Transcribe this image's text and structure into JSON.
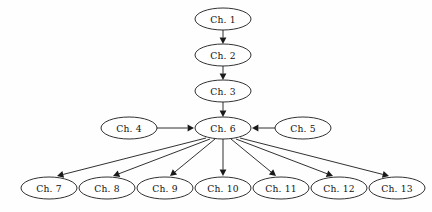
{
  "figure": {
    "type": "directed-graph",
    "background_color": "#fefefe",
    "stroke_color": "#1a1a1a",
    "node_fill": "#ffffff",
    "node_shape": "ellipse",
    "width": 432,
    "height": 212
  },
  "nodes": [
    {
      "id": "ch1",
      "label": "Ch. 1",
      "cx": 223,
      "cy": 19,
      "rx": 28,
      "ry": 11
    },
    {
      "id": "ch2",
      "label": "Ch. 2",
      "cx": 223,
      "cy": 55,
      "rx": 28,
      "ry": 11
    },
    {
      "id": "ch3",
      "label": "Ch. 3",
      "cx": 223,
      "cy": 91,
      "rx": 28,
      "ry": 11
    },
    {
      "id": "ch4",
      "label": "Ch. 4",
      "cx": 129,
      "cy": 128,
      "rx": 28,
      "ry": 11
    },
    {
      "id": "ch6",
      "label": "Ch. 6",
      "cx": 223,
      "cy": 128,
      "rx": 28,
      "ry": 11
    },
    {
      "id": "ch5",
      "label": "Ch. 5",
      "cx": 303,
      "cy": 128,
      "rx": 28,
      "ry": 11
    },
    {
      "id": "ch7",
      "label": "Ch. 7",
      "cx": 49,
      "cy": 188,
      "rx": 28,
      "ry": 11
    },
    {
      "id": "ch8",
      "label": "Ch. 8",
      "cx": 107,
      "cy": 188,
      "rx": 28,
      "ry": 11
    },
    {
      "id": "ch9",
      "label": "Ch. 9",
      "cx": 165,
      "cy": 188,
      "rx": 28,
      "ry": 11
    },
    {
      "id": "ch10",
      "label": "Ch. 10",
      "cx": 223,
      "cy": 188,
      "rx": 28,
      "ry": 11
    },
    {
      "id": "ch11",
      "label": "Ch. 11",
      "cx": 281,
      "cy": 188,
      "rx": 28,
      "ry": 11
    },
    {
      "id": "ch12",
      "label": "Ch. 12",
      "cx": 339,
      "cy": 188,
      "rx": 28,
      "ry": 11
    },
    {
      "id": "ch13",
      "label": "Ch. 13",
      "cx": 397,
      "cy": 188,
      "rx": 28,
      "ry": 11
    }
  ],
  "edges": [
    {
      "from": "ch1",
      "to": "ch2",
      "x1": 223,
      "y1": 30,
      "x2": 223,
      "y2": 44
    },
    {
      "from": "ch2",
      "to": "ch3",
      "x1": 223,
      "y1": 66,
      "x2": 223,
      "y2": 80
    },
    {
      "from": "ch3",
      "to": "ch6",
      "x1": 223,
      "y1": 102,
      "x2": 223,
      "y2": 117
    },
    {
      "from": "ch4",
      "to": "ch6",
      "x1": 157,
      "y1": 128,
      "x2": 194,
      "y2": 128
    },
    {
      "from": "ch5",
      "to": "ch6",
      "x1": 275,
      "y1": 128,
      "x2": 252,
      "y2": 128
    },
    {
      "from": "ch6",
      "to": "ch7",
      "x1": 206,
      "y1": 138,
      "x2": 57,
      "y2": 176
    },
    {
      "from": "ch6",
      "to": "ch8",
      "x1": 210,
      "y1": 139,
      "x2": 113,
      "y2": 176
    },
    {
      "from": "ch6",
      "to": "ch9",
      "x1": 215,
      "y1": 139,
      "x2": 170,
      "y2": 176
    },
    {
      "from": "ch6",
      "to": "ch10",
      "x1": 223,
      "y1": 139,
      "x2": 223,
      "y2": 176
    },
    {
      "from": "ch6",
      "to": "ch11",
      "x1": 231,
      "y1": 139,
      "x2": 276,
      "y2": 176
    },
    {
      "from": "ch6",
      "to": "ch12",
      "x1": 236,
      "y1": 139,
      "x2": 333,
      "y2": 176
    },
    {
      "from": "ch6",
      "to": "ch13",
      "x1": 240,
      "y1": 138,
      "x2": 389,
      "y2": 176
    }
  ]
}
